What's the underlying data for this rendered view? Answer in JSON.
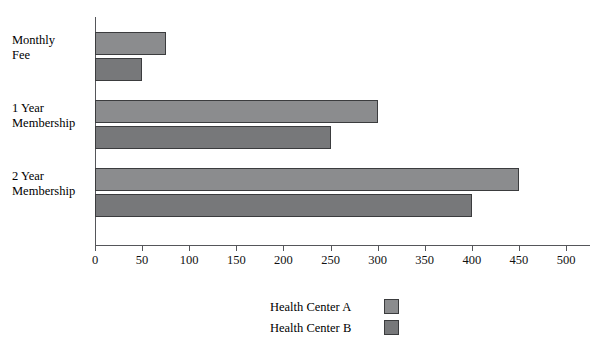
{
  "chart_data": {
    "type": "bar",
    "orientation": "horizontal",
    "title": "",
    "xlabel": "",
    "ylabel": "",
    "categories": [
      "Monthly Fee",
      "1 Year Membership",
      "2 Year Membership"
    ],
    "series": [
      {
        "name": "Health Center A",
        "values": [
          75,
          300,
          450
        ],
        "color": "#8b8c8e"
      },
      {
        "name": "Health Center B",
        "values": [
          50,
          250,
          400
        ],
        "color": "#77787a"
      }
    ],
    "xlim": [
      0,
      500
    ],
    "xticks": [
      0,
      50,
      100,
      150,
      200,
      250,
      300,
      350,
      400,
      450,
      500
    ],
    "xtick_labels": [
      "0",
      "50",
      "100",
      "150",
      "200",
      "250",
      "300",
      "350",
      "400",
      "450",
      "500"
    ],
    "grid": false,
    "legend_position": "bottom-center"
  },
  "category_label_lines": [
    [
      "Monthly",
      "Fee"
    ],
    [
      "1 Year",
      "Membership"
    ],
    [
      "2 Year",
      "Membership"
    ]
  ],
  "legend": {
    "entries": [
      {
        "label": "Health Center A"
      },
      {
        "label": "Health Center B"
      }
    ]
  }
}
